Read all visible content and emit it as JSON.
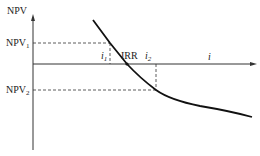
{
  "diagram": {
    "y_axis_label": "NPV",
    "x_axis_label": "i",
    "npv1_label": "NPV",
    "npv1_sub": "1",
    "npv2_label": "NPV",
    "npv2_sub": "2",
    "i1_label": "i",
    "i1_sub": "1",
    "i2_label": "i",
    "i2_sub": "2",
    "irr_label": "IRR",
    "colors": {
      "line": "#111111",
      "axis": "#333333",
      "dash": "#333333"
    }
  }
}
